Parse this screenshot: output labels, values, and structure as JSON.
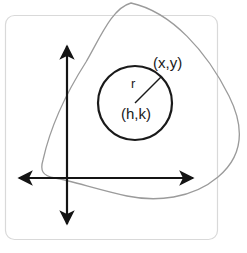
{
  "figure": {
    "cropped_header_text": "",
    "colors": {
      "background": "#ffffff",
      "panel_border": "#d9d9d9",
      "blob_stroke": "#9b9b9b",
      "axis_stroke": "#141414",
      "circle_stroke": "#1a1a1a",
      "radius_stroke": "#1a1a1a",
      "label_text": "#1a1a1a"
    },
    "panel": {
      "x": 5,
      "y": 15,
      "width": 213,
      "height": 225,
      "corner_radius": 9
    },
    "axes": {
      "vertical": {
        "x": 67,
        "y_top": 42,
        "y_bottom": 228
      },
      "horizontal": {
        "y": 178,
        "x_left": 15,
        "x_right": 197
      },
      "arrowheads": 4
    },
    "circle": {
      "center_x": 135,
      "center_y": 103,
      "radius": 37
    },
    "radius_line": {
      "x1": 135,
      "y1": 103,
      "x2": 161,
      "y2": 77
    },
    "labels": {
      "point_on_circle": "(x,y)",
      "radius": "r",
      "center": "(h,k)"
    },
    "label_positions": {
      "point_on_circle": {
        "x": 153,
        "y": 64
      },
      "radius": {
        "x": 131,
        "y": 85
      },
      "center": {
        "x": 121,
        "y": 115
      }
    }
  }
}
